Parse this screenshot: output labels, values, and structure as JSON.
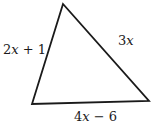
{
  "figure": {
    "shape": "triangle",
    "stroke_color": "#1a1a1a",
    "vertices": {
      "top": [
        63,
        4
      ],
      "bottom_left": [
        32,
        104
      ],
      "bottom_right": [
        149,
        101
      ]
    },
    "sides": {
      "left": {
        "var": "x",
        "label_pre": "2",
        "label_post": " + 1"
      },
      "right": {
        "var": "x",
        "label_pre": "3",
        "label_post": ""
      },
      "bottom": {
        "var": "x",
        "label_pre": "4",
        "label_post": " − 6"
      }
    }
  }
}
